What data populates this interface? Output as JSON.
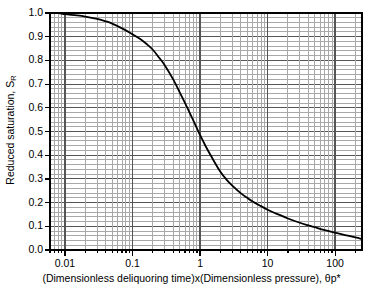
{
  "chart_data": {
    "type": "line",
    "title": "",
    "xlabel": "(Dimensionless deliquoring time)x(Dimensionless pressure), θp*",
    "ylabel_main": "Reduced saturation, S",
    "ylabel_sub": "R",
    "xscale": "log",
    "yscale": "linear",
    "xlim": [
      0.006,
      250
    ],
    "ylim": [
      0.0,
      1.0
    ],
    "grid": "major-and-minor",
    "legend": "none",
    "x_major_ticks": [
      0.01,
      0.1,
      1,
      10,
      100
    ],
    "x_tick_labels": [
      "0.01",
      "0.1",
      "1",
      "10",
      "100"
    ],
    "y_major_ticks": [
      0.0,
      0.1,
      0.2,
      0.3,
      0.4,
      0.5,
      0.6,
      0.7,
      0.8,
      0.9,
      1.0
    ],
    "y_tick_labels": [
      "0.0",
      "0.1",
      "0.2",
      "0.3",
      "0.4",
      "0.5",
      "0.6",
      "0.7",
      "0.8",
      "0.9",
      "1.0"
    ],
    "y_minor_step": 0.02,
    "series": [
      {
        "name": "Reduced saturation curve",
        "color": "#000000",
        "x": [
          0.006,
          0.008,
          0.01,
          0.015,
          0.02,
          0.03,
          0.04,
          0.05,
          0.07,
          0.09,
          0.1,
          0.13,
          0.16,
          0.2,
          0.25,
          0.3,
          0.4,
          0.5,
          0.6,
          0.7,
          0.8,
          0.9,
          1.0,
          1.2,
          1.5,
          2.0,
          2.5,
          3.0,
          4.0,
          5.0,
          6.0,
          8.0,
          10.0,
          13.0,
          16.0,
          20.0,
          30.0,
          40.0,
          50.0,
          70.0,
          100.0,
          140.0,
          200.0,
          250.0
        ],
        "y": [
          1.0,
          1.0,
          0.995,
          0.99,
          0.985,
          0.975,
          0.965,
          0.955,
          0.935,
          0.918,
          0.91,
          0.89,
          0.87,
          0.845,
          0.81,
          0.78,
          0.72,
          0.665,
          0.62,
          0.58,
          0.545,
          0.513,
          0.485,
          0.44,
          0.39,
          0.33,
          0.295,
          0.272,
          0.24,
          0.22,
          0.205,
          0.185,
          0.17,
          0.155,
          0.145,
          0.133,
          0.115,
          0.104,
          0.096,
          0.084,
          0.073,
          0.063,
          0.053,
          0.046
        ]
      }
    ]
  },
  "axes_geometry": {
    "plot_left_px": 50,
    "plot_right_px": 362,
    "plot_top_px": 13,
    "plot_bottom_px": 250
  },
  "colors": {
    "curve": "#000000",
    "axis": "#000000",
    "major_grid": "#555555",
    "minor_grid": "#a8a8a8",
    "background": "#ffffff"
  }
}
